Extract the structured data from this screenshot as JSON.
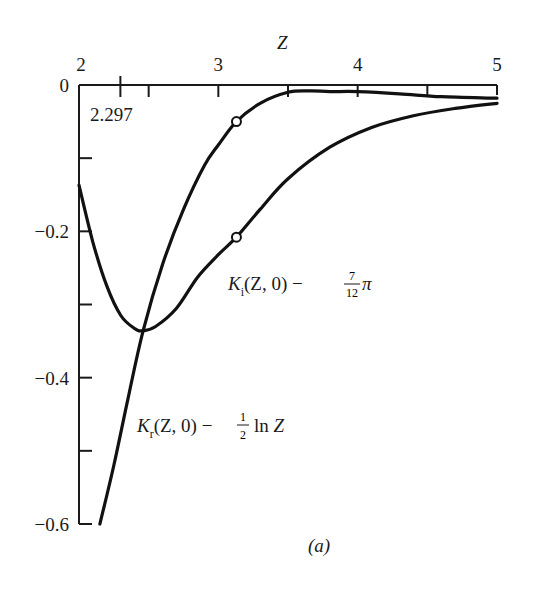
{
  "chart_data": {
    "type": "line",
    "title": "",
    "panel_label": "(a)",
    "xlabel": "Z",
    "ylabel": "",
    "xlim": [
      2,
      5
    ],
    "ylim": [
      -0.6,
      0
    ],
    "grid": false,
    "x_axis_position": "top",
    "x_ticks": [
      2,
      3,
      4,
      5
    ],
    "x_tick_labels": [
      "2",
      "3",
      "4",
      "5"
    ],
    "x_minor_ticks": [
      2.297,
      2.5,
      3.5,
      4.5
    ],
    "x_annotation": {
      "text": "2.297",
      "at": 2.297
    },
    "y_ticks": [
      0,
      -0.1,
      -0.2,
      -0.3,
      -0.4,
      -0.5,
      -0.6
    ],
    "y_tick_labels": [
      "0",
      "",
      "-0.2",
      "",
      "-0.4",
      "",
      "-0.6"
    ],
    "series": [
      {
        "name": "K_i(Z, 0) − (7/12)π",
        "label_parts": {
          "K": "K",
          "sub": "i",
          "args": "(Z, 0) − ",
          "num": "7",
          "den": "12",
          "tail": "π"
        },
        "x": [
          2.0,
          2.1,
          2.2,
          2.3,
          2.4,
          2.46,
          2.55,
          2.7,
          2.85,
          3.0,
          3.13,
          3.3,
          3.5,
          3.8,
          4.1,
          4.4,
          4.7,
          5.0
        ],
        "y": [
          -0.137,
          -0.215,
          -0.275,
          -0.315,
          -0.333,
          -0.336,
          -0.33,
          -0.305,
          -0.263,
          -0.232,
          -0.208,
          -0.17,
          -0.128,
          -0.085,
          -0.058,
          -0.042,
          -0.032,
          -0.025
        ],
        "marker_points": [
          {
            "x": 3.13,
            "y": -0.208
          }
        ]
      },
      {
        "name": "K_r(Z, 0) − (1/2) ln Z",
        "label_parts": {
          "K": "K",
          "sub": "r",
          "args": "(Z, 0) − ",
          "num": "1",
          "den": "2",
          "tail": " ln Z"
        },
        "x": [
          2.15,
          2.25,
          2.35,
          2.46,
          2.6,
          2.75,
          2.9,
          3.0,
          3.13,
          3.3,
          3.5,
          3.66,
          3.8,
          4.0,
          4.3,
          4.6,
          5.0
        ],
        "y": [
          -0.6,
          -0.52,
          -0.43,
          -0.336,
          -0.245,
          -0.17,
          -0.11,
          -0.082,
          -0.05,
          -0.025,
          -0.01,
          -0.008,
          -0.009,
          -0.009,
          -0.012,
          -0.016,
          -0.018
        ],
        "marker_points": [
          {
            "x": 3.13,
            "y": -0.05
          }
        ]
      }
    ]
  }
}
